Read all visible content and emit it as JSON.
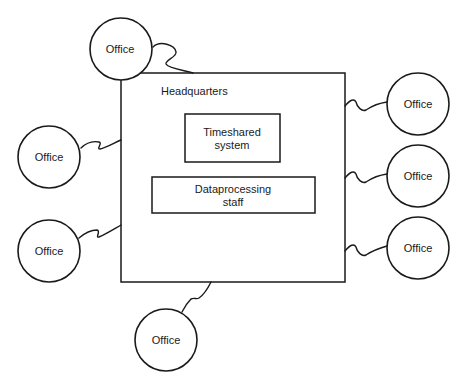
{
  "diagram": {
    "headquarters": {
      "label": "Headquarters",
      "components": [
        {
          "label_line1": "Timeshared",
          "label_line2": "system"
        },
        {
          "label_line1": "Dataprocessing",
          "label_line2": "staff"
        }
      ]
    },
    "offices": [
      {
        "label": "Office",
        "position": "top-left"
      },
      {
        "label": "Office",
        "position": "right-upper"
      },
      {
        "label": "Office",
        "position": "right-middle"
      },
      {
        "label": "Office",
        "position": "right-lower"
      },
      {
        "label": "Office",
        "position": "left-upper"
      },
      {
        "label": "Office",
        "position": "left-lower"
      },
      {
        "label": "Office",
        "position": "bottom"
      }
    ]
  }
}
